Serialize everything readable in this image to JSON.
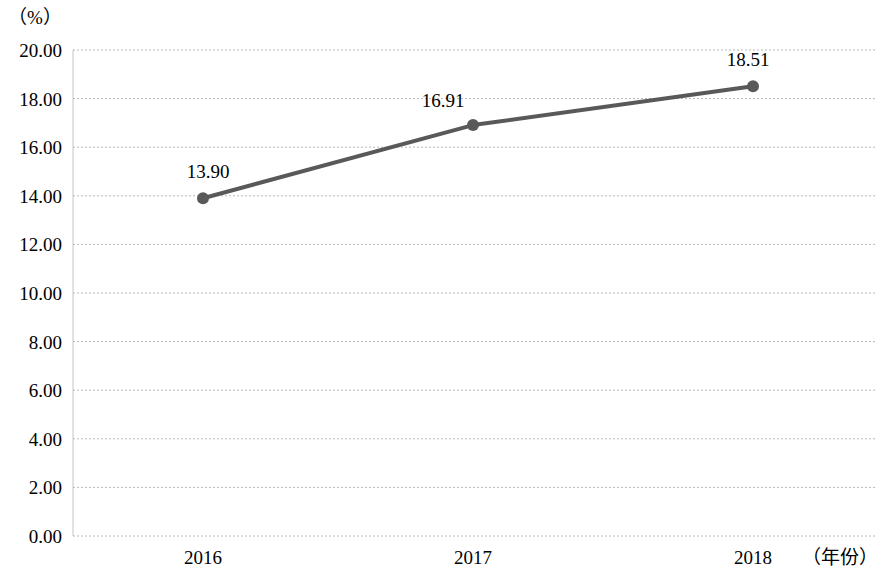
{
  "chart_data": {
    "type": "line",
    "title": "",
    "xlabel": "（年份）",
    "ylabel": "（%）",
    "categories": [
      "2016",
      "2017",
      "2018"
    ],
    "values": [
      13.9,
      16.91,
      18.51
    ],
    "point_labels": [
      "13.90",
      "16.91",
      "18.51"
    ],
    "series": [
      {
        "name": "",
        "values": [
          13.9,
          16.91,
          18.51
        ]
      }
    ],
    "ylim": [
      0,
      20
    ],
    "ytick_step": 2,
    "ytick_labels": [
      "20.00",
      "18.00",
      "16.00",
      "14.00",
      "12.00",
      "10.00",
      "8.00",
      "6.00",
      "4.00",
      "2.00",
      "0.00"
    ],
    "ytick_values": [
      20,
      18,
      16,
      14,
      12,
      10,
      8,
      6,
      4,
      2,
      0
    ],
    "grid": true,
    "grid_style": "dotted",
    "legend": false,
    "legend_position": "none",
    "colors": {
      "line": "#595959",
      "marker": "#595959",
      "grid": "#b8b8b8",
      "axis": "#c4c4c4",
      "text": "#000000",
      "background": "#ffffff"
    },
    "marker": "circle",
    "line_width": 4,
    "marker_size": 9
  }
}
